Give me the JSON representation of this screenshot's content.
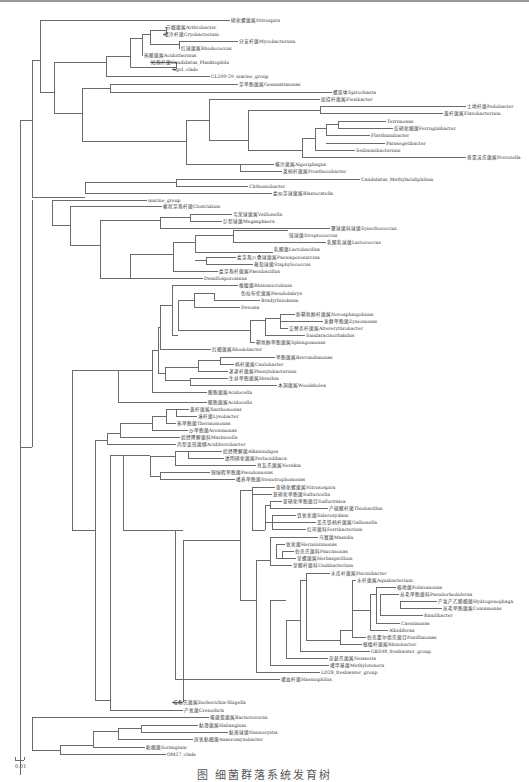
{
  "figure": {
    "type": "phylogenetic-tree",
    "scale_bar_label": "0.01",
    "caption": "图 细菌群落系统发育树"
  },
  "taxa": [
    {
      "label": "硝化螺菌属Nitrospira",
      "x": 230,
      "y": 20
    },
    {
      "label": "节细菌属Arthrobacter",
      "x": 165,
      "y": 27
    },
    {
      "label": "嗜冷杆菌Cryobacterium",
      "x": 163,
      "y": 34
    },
    {
      "label": "分支杆菌Mycobacterium",
      "x": 238,
      "y": 41
    },
    {
      "label": "红球菌属Rhodococcus",
      "x": 180,
      "y": 48
    },
    {
      "label": "热酸菌属Acidothermus",
      "x": 143,
      "y": 55
    },
    {
      "label": "短孢杆菌Candidatus_Planktophila",
      "x": 150,
      "y": 62
    },
    {
      "label": "hgcI_clade",
      "x": 172,
      "y": 69
    },
    {
      "label": "CL500-29_marine_group",
      "x": 210,
      "y": 76
    },
    {
      "label": "芽单胞菌属Gemmatimonas",
      "x": 238,
      "y": 84
    },
    {
      "label": "螺旋体Spirochaeta",
      "x": 332,
      "y": 92
    },
    {
      "label": "屈挠杆菌属Flexibacter",
      "x": 320,
      "y": 99
    },
    {
      "label": "土地杆菌Pedobacter",
      "x": 466,
      "y": 106
    },
    {
      "label": "黄杆菌属Flavobacterium",
      "x": 443,
      "y": 113
    },
    {
      "label": "Terrimonas",
      "x": 386,
      "y": 121
    },
    {
      "label": "反硝化细菌Ferruginibacter",
      "x": 393,
      "y": 128
    },
    {
      "label": "Flavihumibacter",
      "x": 370,
      "y": 135
    },
    {
      "label": "Parasegetibacter",
      "x": 385,
      "y": 143
    },
    {
      "label": "Sediminibacterium",
      "x": 355,
      "y": 150
    },
    {
      "label": "普雷沃氏菌属Prevotella",
      "x": 466,
      "y": 157
    },
    {
      "label": "噬冷菌属Algoriphagus",
      "x": 274,
      "y": 164
    },
    {
      "label": "荚柄杆菌属Prosthecobacter",
      "x": 282,
      "y": 171
    },
    {
      "label": "Candidatus_Methylacidiphilum",
      "x": 360,
      "y": 179
    },
    {
      "label": "Chthoniobacter",
      "x": 248,
      "y": 186
    },
    {
      "label": "类似芽球菌属Blastocatella",
      "x": 272,
      "y": 193
    },
    {
      "label": "marine_group",
      "x": 147,
      "y": 200
    },
    {
      "label": "梭状芽孢杆菌Clostridium",
      "x": 162,
      "y": 206
    },
    {
      "label": "韦荣球菌属Veillonella",
      "x": 232,
      "y": 214
    },
    {
      "label": "巨型球菌Megasphaera",
      "x": 222,
      "y": 221
    },
    {
      "label": "聚球菌科球菌Synechococcus",
      "x": 330,
      "y": 228
    },
    {
      "label": "链球菌Streptococcus",
      "x": 288,
      "y": 235
    },
    {
      "label": "乳酸乳球菌Lactococcus",
      "x": 326,
      "y": 242
    },
    {
      "label": "乳酸菌Lactobacillus",
      "x": 273,
      "y": 249
    },
    {
      "label": "类芽孢八叠球菌属Paenisporosarcina",
      "x": 236,
      "y": 257
    },
    {
      "label": "葡萄球菌Staphylococcus",
      "x": 253,
      "y": 264
    },
    {
      "label": "类芽孢杆菌属Paenibacillus",
      "x": 218,
      "y": 271
    },
    {
      "label": "Desulfosporosinus",
      "x": 203,
      "y": 278
    },
    {
      "label": "根瘤菌Rhizomicrobium",
      "x": 238,
      "y": 285
    },
    {
      "label": "伪拉布伦菌属Pseudolabrys",
      "x": 240,
      "y": 293
    },
    {
      "label": "Bradyrhizobium",
      "x": 260,
      "y": 300
    },
    {
      "label": "Devosia",
      "x": 240,
      "y": 307
    },
    {
      "label": "新鞘氨醇杆菌属Novosphingobium",
      "x": 295,
      "y": 314
    },
    {
      "label": "发酵单胞菌Zymomonas",
      "x": 323,
      "y": 321
    },
    {
      "label": "交替赤杆菌属Altererythrobacter",
      "x": 288,
      "y": 328
    },
    {
      "label": "Sandaracinorhabdus",
      "x": 305,
      "y": 335
    },
    {
      "label": "鞘氨醇单胞菌属Sphingomonas",
      "x": 255,
      "y": 342
    },
    {
      "label": "红细菌属Rhodobacter",
      "x": 211,
      "y": 349
    },
    {
      "label": "单胞菌属Brevundimonas",
      "x": 275,
      "y": 357
    },
    {
      "label": "柄杆菌属Caulobacter",
      "x": 234,
      "y": 364
    },
    {
      "label": "茎茎杆菌属Phenylobacterium",
      "x": 228,
      "y": 371
    },
    {
      "label": "生丝单胞菌属Hirschia",
      "x": 228,
      "y": 378
    },
    {
      "label": "木洞菌属Woodsholea",
      "x": 277,
      "y": 385
    },
    {
      "label": "酸胞菌属Acidocella",
      "x": 207,
      "y": 392
    },
    {
      "label": "酸胞菌属Acidocella",
      "x": 207,
      "y": 402
    },
    {
      "label": "黄杆菌属Xanthomonas",
      "x": 189,
      "y": 409
    },
    {
      "label": "溶杆菌Lysobacter",
      "x": 197,
      "y": 416
    },
    {
      "label": "热单胞菌Thermomonas",
      "x": 176,
      "y": 423
    },
    {
      "label": "沙单胞菌Arenimonas",
      "x": 188,
      "y": 430
    },
    {
      "label": "烷烃降解菌科Marinicella",
      "x": 180,
      "y": 437
    },
    {
      "label": "丙型变形菌纲Acidiferrobacter",
      "x": 176,
      "y": 444
    },
    {
      "label": "烷烃降解菌Alkanindiges",
      "x": 222,
      "y": 451
    },
    {
      "label": "透明硝化菌属Perlucidibaca",
      "x": 224,
      "y": 458
    },
    {
      "label": "肖瓦氏菌属Nevskia",
      "x": 256,
      "y": 465
    },
    {
      "label": "铜绿假单胞菌Pseudomonas",
      "x": 210,
      "y": 472
    },
    {
      "label": "嗜养单胞菌Stenotrophomonas",
      "x": 235,
      "y": 479
    },
    {
      "label": "亚硝化螺菌属Nitrosospira",
      "x": 275,
      "y": 487
    },
    {
      "label": "亚硝化单胞菌Sulfuricella",
      "x": 272,
      "y": 494
    },
    {
      "label": "亚硝化单胞菌目Sulfuritalea",
      "x": 282,
      "y": 501
    },
    {
      "label": "产硫酸杆菌Thiobacillus",
      "x": 328,
      "y": 508
    },
    {
      "label": "铁氧化菌Sideroxydans",
      "x": 296,
      "y": 515
    },
    {
      "label": "盖氏铁柄杆菌属Gallionella",
      "x": 316,
      "y": 522
    },
    {
      "label": "红环菌科Ferribacterium",
      "x": 306,
      "y": 529
    },
    {
      "label": "马赛菌Massilia",
      "x": 318,
      "y": 537
    },
    {
      "label": "氧化菌Herminiimonas",
      "x": 285,
      "y": 544
    },
    {
      "label": "伯克氏菌科Paucimonas",
      "x": 294,
      "y": 551
    },
    {
      "label": "草螺菌属Herbaspirillum",
      "x": 296,
      "y": 558
    },
    {
      "label": "草酸杆菌科Undibacterium",
      "x": 292,
      "y": 565
    },
    {
      "label": "水库杆菌属Piscinibacter",
      "x": 330,
      "y": 573
    },
    {
      "label": "水杆菌属Aquabacterium",
      "x": 356,
      "y": 580
    },
    {
      "label": "极地菌Polaromonas",
      "x": 396,
      "y": 587
    },
    {
      "label": "丛毛单胞菌科Pseudorhodoferax",
      "x": 399,
      "y": 594
    },
    {
      "label": "产氢产乙酸细菌Hydrogenophaga",
      "x": 437,
      "y": 601
    },
    {
      "label": "丛毛单胞菌属Comamonas",
      "x": 442,
      "y": 608
    },
    {
      "label": "Ramlibacter",
      "x": 423,
      "y": 615
    },
    {
      "label": "Caenimonas",
      "x": 400,
      "y": 623
    },
    {
      "label": "Albidiferax",
      "x": 388,
      "y": 630
    },
    {
      "label": "伯克霍尔德氏菌目Pusillimonas",
      "x": 366,
      "y": 637
    },
    {
      "label": "根瘤杆菌属Rhizobacter",
      "x": 362,
      "y": 644
    },
    {
      "label": "GKS98_freshwater_group",
      "x": 370,
      "y": 651
    },
    {
      "label": "奈瑟氏菌属Neisseria",
      "x": 328,
      "y": 658
    },
    {
      "label": "嗜甲基菌Methylotenera",
      "x": 329,
      "y": 665
    },
    {
      "label": "LD28_freshwater_group",
      "x": 320,
      "y": 672
    },
    {
      "label": "嗜血杆菌Haemophilus",
      "x": 280,
      "y": 679
    },
    {
      "label": "埃希氏菌属Escherichia-Shigella",
      "x": 172,
      "y": 702
    },
    {
      "label": "产氧菌Crenothrix",
      "x": 183,
      "y": 710
    },
    {
      "label": "噬菌弧菌属Bacteriovorax",
      "x": 209,
      "y": 717
    },
    {
      "label": "黏滑菌属Haliangium",
      "x": 198,
      "y": 725
    },
    {
      "label": "黏液球菌Nannocystis",
      "x": 228,
      "y": 732
    },
    {
      "label": "厌氧粘细菌Anaeromyxobacter",
      "x": 193,
      "y": 739
    },
    {
      "label": "粘细菌Sorangium",
      "x": 145,
      "y": 747
    },
    {
      "label": "OM27_clade",
      "x": 166,
      "y": 754
    }
  ]
}
